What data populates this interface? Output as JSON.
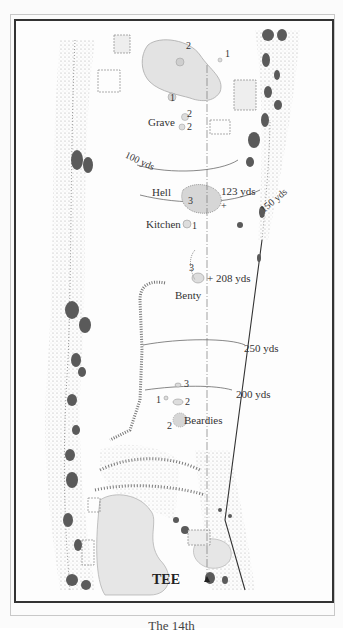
{
  "map": {
    "hole_caption": "The 14th",
    "tee_label": "TEE",
    "bunkers": [
      {
        "name": "Grave",
        "numbers": [
          "2",
          "2"
        ]
      },
      {
        "name": "Hell",
        "numbers": [
          "3"
        ]
      },
      {
        "name": "Kitchen",
        "numbers": [
          "1"
        ]
      },
      {
        "name": "Benty",
        "numbers": [
          "3"
        ]
      },
      {
        "name": "Beardies",
        "numbers": [
          "1",
          "2",
          "3",
          "2"
        ]
      }
    ],
    "green_markers": [
      "2",
      "1",
      "1"
    ],
    "yardages": {
      "y100": "100 yds",
      "y123": "123 yds",
      "y150": "150 yds",
      "y208": "+ 208 yds",
      "y250": "250 yds",
      "y200": "200 yds"
    },
    "colors": {
      "fairway": "#fdfdfd",
      "green": "#e3e3e3",
      "rough_dots": "#8a8a8a",
      "gorse": "#555555",
      "frame": "#333333"
    }
  }
}
